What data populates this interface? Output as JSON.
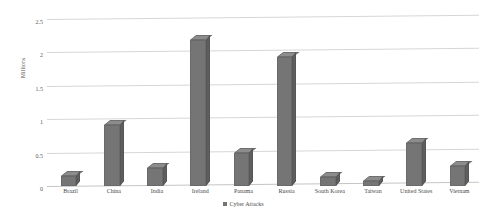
{
  "chart_data": {
    "type": "bar",
    "title": "",
    "xlabel": "",
    "ylabel": "Millions",
    "categories": [
      "Brazil",
      "China",
      "India",
      "Ireland",
      "Panama",
      "Russia",
      "South Korea",
      "Taiwan",
      "United States",
      "Vietnam"
    ],
    "series": [
      {
        "name": "Cyber Attacks",
        "values": [
          0.15,
          0.92,
          0.27,
          2.18,
          0.5,
          1.93,
          0.13,
          0.08,
          0.64,
          0.3
        ]
      }
    ],
    "ylim": [
      0,
      2.5
    ],
    "yticks": [
      0,
      0.5,
      1,
      1.5,
      2,
      2.5
    ],
    "ytick_labels": [
      "0",
      "0.5",
      "1",
      "1.5",
      "2",
      "2.5"
    ],
    "grid": true,
    "legend_position": "bottom",
    "style": "3d-column",
    "colors": {
      "bar_front": "#757575",
      "bar_top": "#8c8c8c",
      "bar_side": "#5e5e5e",
      "gridline": "#d6d6d6",
      "background": "#ffffff",
      "text": "#4a4a4a"
    }
  },
  "legend": {
    "marker": "square-marker",
    "label": "Cyber Attacks"
  }
}
